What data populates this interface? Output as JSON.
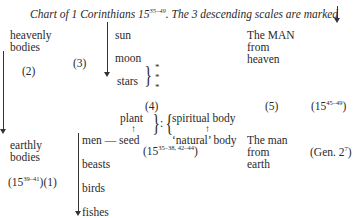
{
  "title": {
    "prefix": "Chart of ",
    "book": "1 Corinthians 15",
    "book_sup": "35–49",
    "suffix": ". The 3 descending scales are marked"
  },
  "left": {
    "heavenly": [
      "heavenly",
      "bodies"
    ],
    "marker_2": "(2)",
    "earthly": [
      "earthly",
      "bodies"
    ],
    "ref_base": "(15",
    "ref_sup": "39–41",
    "ref_end": ")",
    "marker_1": "(1)"
  },
  "heavenly_scale": {
    "marker_3": "(3)",
    "items": [
      "sun",
      "moon",
      "stars"
    ],
    "stars_brace_items": [
      "*",
      "*",
      "*"
    ]
  },
  "earthly_scale": {
    "items": [
      "men — seed",
      "beasts",
      "birds",
      "fishes"
    ]
  },
  "analogy": {
    "marker_4": "(4)",
    "plant": "plant",
    "seed_arrow": "↑",
    "colon": ":",
    "spiritual": "spiritual body",
    "body_arrow": "↑",
    "natural": "‘natural’ body",
    "ref_base": "(15",
    "ref_sup": "35–38, 42–44",
    "ref_end": ")"
  },
  "right": {
    "man_heaven": [
      "The MAN",
      "from",
      "heaven"
    ],
    "marker_5": "(5)",
    "ref_base": "(15",
    "ref_sup": "45–49",
    "ref_end": ")",
    "man_earth": [
      "The man",
      "from",
      "earth"
    ],
    "gen_base": "(Gen. 2",
    "gen_sup": "7",
    "gen_end": ")"
  }
}
